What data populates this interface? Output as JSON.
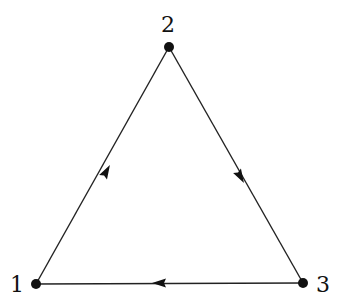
{
  "diagram": {
    "type": "directed-graph",
    "nodes": [
      {
        "id": "1",
        "label": "1",
        "x": 36,
        "y": 284,
        "label_x": 10,
        "label_y": 292
      },
      {
        "id": "2",
        "label": "2",
        "x": 169,
        "y": 47,
        "label_x": 161,
        "label_y": 32
      },
      {
        "id": "3",
        "label": "3",
        "x": 303,
        "y": 283,
        "label_x": 316,
        "label_y": 292
      }
    ],
    "edges": [
      {
        "from": "1",
        "to": "2",
        "arrow_at": [
          106,
          172
        ]
      },
      {
        "from": "2",
        "to": "3",
        "arrow_at": [
          240,
          176
        ]
      },
      {
        "from": "3",
        "to": "1",
        "arrow_at": [
          160,
          283
        ]
      }
    ]
  }
}
